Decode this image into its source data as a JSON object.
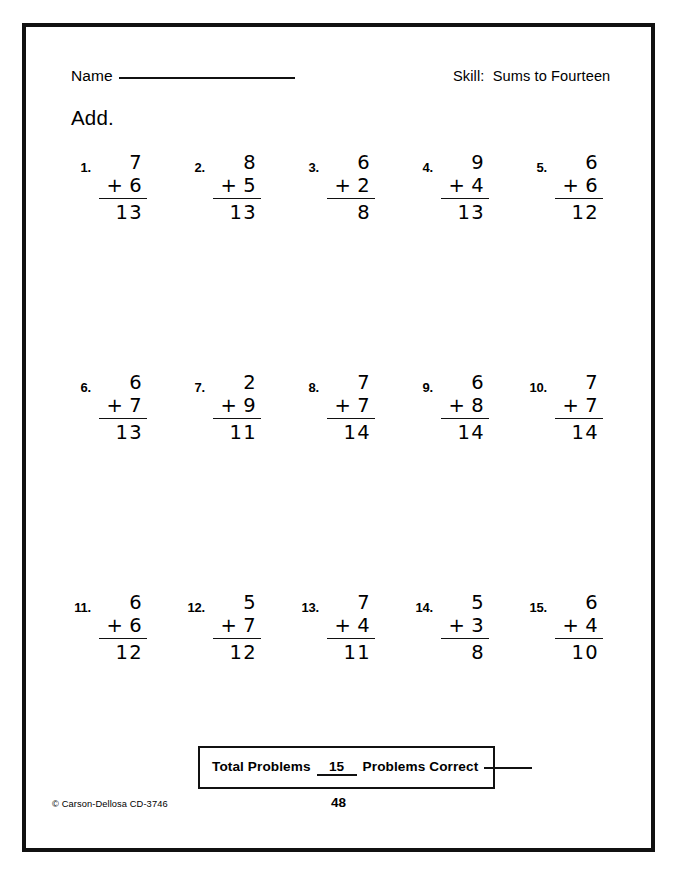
{
  "page": {
    "border_color": "#111111",
    "background": "#ffffff"
  },
  "header": {
    "name_label": "Name",
    "skill_text": "Skill:  Sums to Fourteen"
  },
  "instruction": "Add.",
  "problems": [
    {
      "number": "1.",
      "top": "7",
      "operator": "+",
      "bottom": "6",
      "answer": "13"
    },
    {
      "number": "2.",
      "top": "8",
      "operator": "+",
      "bottom": "5",
      "answer": "13"
    },
    {
      "number": "3.",
      "top": "6",
      "operator": "+",
      "bottom": "2",
      "answer": "8"
    },
    {
      "number": "4.",
      "top": "9",
      "operator": "+",
      "bottom": "4",
      "answer": "13"
    },
    {
      "number": "5.",
      "top": "6",
      "operator": "+",
      "bottom": "6",
      "answer": "12"
    },
    {
      "number": "6.",
      "top": "6",
      "operator": "+",
      "bottom": "7",
      "answer": "13"
    },
    {
      "number": "7.",
      "top": "2",
      "operator": "+",
      "bottom": "9",
      "answer": "11"
    },
    {
      "number": "8.",
      "top": "7",
      "operator": "+",
      "bottom": "7",
      "answer": "14"
    },
    {
      "number": "9.",
      "top": "6",
      "operator": "+",
      "bottom": "8",
      "answer": "14"
    },
    {
      "number": "10.",
      "top": "7",
      "operator": "+",
      "bottom": "7",
      "answer": "14"
    },
    {
      "number": "11.",
      "top": "6",
      "operator": "+",
      "bottom": "6",
      "answer": "12"
    },
    {
      "number": "12.",
      "top": "5",
      "operator": "+",
      "bottom": "7",
      "answer": "12"
    },
    {
      "number": "13.",
      "top": "7",
      "operator": "+",
      "bottom": "4",
      "answer": "11"
    },
    {
      "number": "14.",
      "top": "5",
      "operator": "+",
      "bottom": "3",
      "answer": "8"
    },
    {
      "number": "15.",
      "top": "6",
      "operator": "+",
      "bottom": "4",
      "answer": "10"
    }
  ],
  "totals": {
    "total_problems_label": "Total Problems",
    "total_problems_value": "15",
    "problems_correct_label": "Problems Correct",
    "problems_correct_value": ""
  },
  "footer": {
    "copyright": "© Carson-Dellosa CD-3746",
    "page_number": "48"
  }
}
